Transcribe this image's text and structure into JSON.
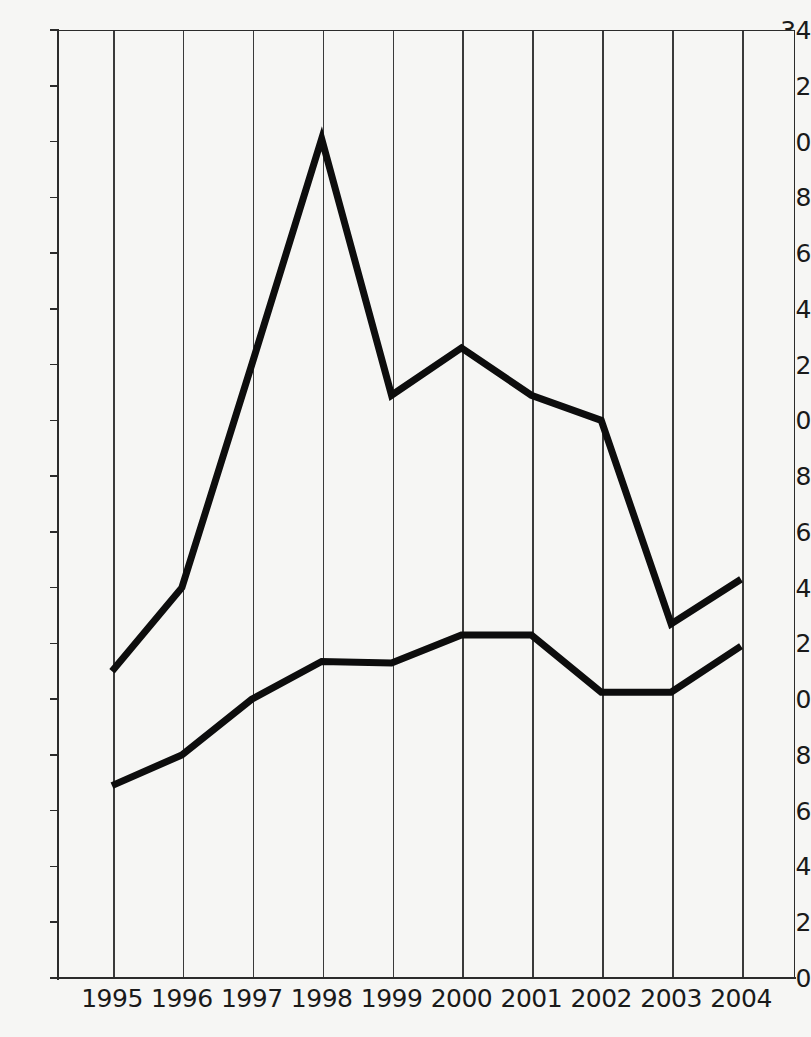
{
  "chart_data": {
    "type": "line",
    "title": "",
    "subtitle": "",
    "xlabel": "",
    "ylabel": "",
    "categories": [
      "1995",
      "1996",
      "1997",
      "1998",
      "1999",
      "2000",
      "2001",
      "2002",
      "2003",
      "2004"
    ],
    "x": [
      1995,
      1996,
      1997,
      1998,
      1999,
      2000,
      2001,
      2002,
      2003,
      2004
    ],
    "series": [
      {
        "name": "upper-series",
        "color": "#0d0d0d",
        "values": [
          11.0,
          14.0,
          22.0,
          30.1,
          20.9,
          22.6,
          20.9,
          20.0,
          12.7,
          14.3
        ]
      },
      {
        "name": "lower-series",
        "color": "#0d0d0d",
        "values": [
          6.9,
          8.0,
          10.0,
          11.35,
          11.3,
          12.3,
          12.3,
          10.25,
          10.25,
          11.9
        ]
      }
    ],
    "ylim": [
      0,
      34
    ],
    "ytick_step": 2,
    "yticks": [
      0,
      2,
      4,
      6,
      8,
      10,
      12,
      14,
      16,
      18,
      20,
      22,
      24,
      26,
      28,
      30,
      32,
      34
    ],
    "ytick_labels": [
      "0",
      "2",
      "4",
      "6",
      "8",
      "10",
      "12",
      "14",
      "16",
      "18",
      "20",
      "22",
      "24",
      "26",
      "28",
      "30",
      "32",
      "34"
    ],
    "grid": {
      "vertical": true,
      "horizontal": false,
      "color": "#3a3a3a"
    },
    "legend": {
      "visible": false,
      "position": "none",
      "entries": []
    },
    "annotations": [],
    "background_color": "#f6f6f4",
    "axis_color": "#2b2b2b"
  }
}
